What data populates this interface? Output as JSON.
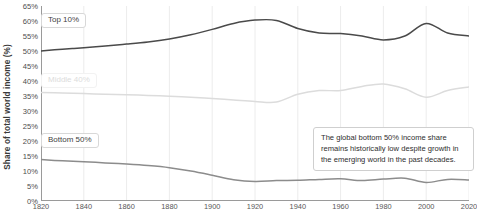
{
  "chart_data": {
    "type": "line",
    "title": "",
    "subtitle": "",
    "xlabel": "",
    "ylabel": "Share of total world income (%)",
    "xlim": [
      1820,
      2020
    ],
    "ylim": [
      0,
      65
    ],
    "grid": "vertical",
    "legend_position": "inline-labels",
    "y_ticks": [
      "0%",
      "5%",
      "10%",
      "15%",
      "20%",
      "25%",
      "30%",
      "35%",
      "40%",
      "45%",
      "50%",
      "55%",
      "60%",
      "65%"
    ],
    "y_tick_values": [
      0,
      5,
      10,
      15,
      20,
      25,
      30,
      35,
      40,
      45,
      50,
      55,
      60,
      65
    ],
    "x_ticks": [
      "1820",
      "1840",
      "1860",
      "1880",
      "1900",
      "1920",
      "1940",
      "1960",
      "1980",
      "2000",
      "2020"
    ],
    "x_tick_values": [
      1820,
      1840,
      1860,
      1880,
      1900,
      1920,
      1940,
      1960,
      1980,
      2000,
      2020
    ],
    "x": [
      1820,
      1830,
      1840,
      1850,
      1860,
      1870,
      1880,
      1890,
      1900,
      1910,
      1920,
      1930,
      1940,
      1950,
      1960,
      1970,
      1980,
      1990,
      2000,
      2010,
      2020
    ],
    "series": [
      {
        "name": "Top 10%",
        "color": "#4a4a4a",
        "values": [
          50.0,
          50.6,
          51.1,
          51.7,
          52.3,
          53.0,
          54.0,
          55.4,
          57.2,
          59.2,
          60.3,
          60.2,
          57.5,
          56.0,
          55.8,
          55.0,
          53.7,
          55.0,
          59.2,
          56.0,
          55.0
        ]
      },
      {
        "name": "Middle 40%",
        "color": "#dcdcdc",
        "values": [
          36.2,
          36.0,
          35.8,
          35.6,
          35.4,
          35.2,
          34.9,
          34.6,
          34.2,
          33.7,
          33.2,
          33.0,
          35.6,
          36.8,
          36.8,
          38.2,
          39.0,
          37.4,
          34.6,
          36.8,
          38.0
        ]
      },
      {
        "name": "Bottom 50%",
        "color": "#8c8c8c",
        "values": [
          13.8,
          13.4,
          13.1,
          12.7,
          12.3,
          11.8,
          11.1,
          10.0,
          8.6,
          7.1,
          6.5,
          6.8,
          6.9,
          7.2,
          7.4,
          6.8,
          7.3,
          7.6,
          6.2,
          7.2,
          7.0
        ]
      }
    ],
    "annotations": [
      {
        "id": "bottom50-note",
        "text": "The global bottom 50% income share remains historically low despite growth in the emerging world in the past decades."
      }
    ]
  },
  "labels": {
    "series_top10": "Top 10%",
    "series_middle40": "Middle 40%",
    "series_bottom50": "Bottom 50%"
  }
}
